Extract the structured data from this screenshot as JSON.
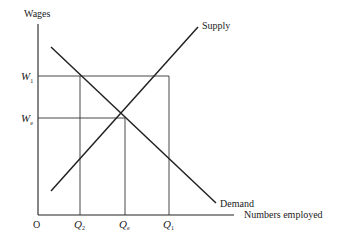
{
  "diagram": {
    "type": "supply-demand-labour-market",
    "y_axis_label": "Wages",
    "x_axis_label": "Numbers employed",
    "origin_label": "O",
    "curves": [
      {
        "name": "Supply",
        "label": "Supply"
      },
      {
        "name": "Demand",
        "label": "Demand"
      }
    ],
    "y_levels": [
      {
        "id": "W1",
        "main": "W",
        "sub": "1"
      },
      {
        "id": "We",
        "main": "W",
        "sub": "e"
      }
    ],
    "x_levels": [
      {
        "id": "Q2",
        "main": "Q",
        "sub": "2"
      },
      {
        "id": "Qe",
        "main": "Q",
        "sub": "e"
      },
      {
        "id": "Q1",
        "main": "Q",
        "sub": "1"
      }
    ]
  }
}
